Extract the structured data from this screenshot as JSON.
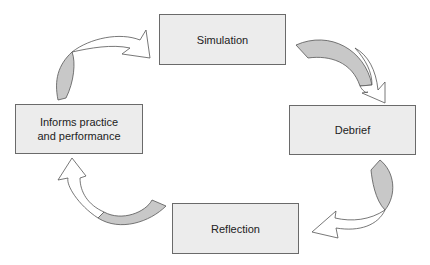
{
  "diagram": {
    "type": "cycle",
    "nodes": [
      {
        "id": "simulation",
        "label": "Simulation"
      },
      {
        "id": "debrief",
        "label": "Debrief"
      },
      {
        "id": "reflection",
        "label": "Reflection"
      },
      {
        "id": "informs",
        "label": "Informs practice\nand performance",
        "line1": "Informs practice",
        "line2": "and performance"
      }
    ],
    "edges": [
      {
        "from": "simulation",
        "to": "debrief"
      },
      {
        "from": "debrief",
        "to": "reflection"
      },
      {
        "from": "reflection",
        "to": "informs"
      },
      {
        "from": "informs",
        "to": "simulation"
      }
    ],
    "colors": {
      "box_fill": "#ececec",
      "box_border": "#6a6a6a",
      "arrow_shade": "#c8c8c8"
    }
  }
}
